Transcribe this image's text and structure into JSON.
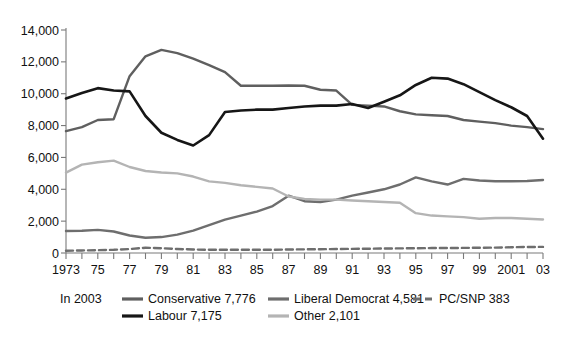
{
  "chart_data": {
    "type": "line",
    "title": "",
    "xlabel": "",
    "ylabel": "",
    "ylim": [
      0,
      14000
    ],
    "xlim": [
      1973,
      2003
    ],
    "yticks": [
      0,
      2000,
      4000,
      6000,
      8000,
      10000,
      12000,
      14000
    ],
    "ytick_labels": [
      "0",
      "2,000",
      "4,000",
      "6,000",
      "8,000",
      "10,000",
      "12,000",
      "14,000"
    ],
    "x": [
      1973,
      1974,
      1975,
      1976,
      1977,
      1978,
      1979,
      1980,
      1981,
      1982,
      1983,
      1984,
      1985,
      1986,
      1987,
      1988,
      1989,
      1990,
      1991,
      1992,
      1993,
      1994,
      1995,
      1996,
      1997,
      1998,
      1999,
      2000,
      2001,
      2002,
      2003
    ],
    "xtick_labels": [
      "1973",
      "",
      "75",
      "",
      "77",
      "",
      "79",
      "",
      "81",
      "",
      "83",
      "",
      "85",
      "",
      "87",
      "",
      "89",
      "",
      "91",
      "",
      "93",
      "",
      "95",
      "",
      "97",
      "",
      "99",
      "",
      "2001",
      "",
      "03"
    ],
    "grid": false,
    "legend_position": "bottom",
    "series": [
      {
        "name": "Conservative",
        "label": "Conservative 7,776",
        "final_value": 7776,
        "color": "#5f5f5f",
        "style": "solid",
        "values": [
          7650,
          7900,
          8350,
          8400,
          11100,
          12350,
          12750,
          12550,
          12200,
          11800,
          11350,
          10500,
          10500,
          10500,
          10520,
          10500,
          10250,
          10200,
          9300,
          9250,
          9200,
          8900,
          8700,
          8650,
          8600,
          8350,
          8250,
          8150,
          8000,
          7900,
          7776
        ]
      },
      {
        "name": "Labour",
        "label": "Labour 7,175",
        "final_value": 7175,
        "color": "#161616",
        "style": "solid",
        "values": [
          9700,
          10050,
          10350,
          10200,
          10150,
          8600,
          7550,
          7100,
          6750,
          7400,
          8850,
          8950,
          9000,
          9000,
          9100,
          9200,
          9250,
          9250,
          9350,
          9100,
          9500,
          9900,
          10550,
          11000,
          10950,
          10600,
          10100,
          9600,
          9150,
          8600,
          7175
        ]
      },
      {
        "name": "Liberal Democrat",
        "label": "Liberal Democrat 4,581",
        "final_value": 4581,
        "color": "#6e6e6e",
        "style": "solid",
        "values": [
          1380,
          1400,
          1450,
          1350,
          1100,
          960,
          1000,
          1150,
          1400,
          1750,
          2100,
          2350,
          2600,
          2950,
          3600,
          3250,
          3200,
          3350,
          3600,
          3800,
          4000,
          4300,
          4750,
          4500,
          4300,
          4650,
          4550,
          4500,
          4500,
          4520,
          4581
        ]
      },
      {
        "name": "Other",
        "label": "Other 2,101",
        "final_value": 2101,
        "color": "#b4b4b4",
        "style": "solid",
        "values": [
          5050,
          5550,
          5700,
          5800,
          5400,
          5150,
          5050,
          5000,
          4800,
          4500,
          4400,
          4250,
          4150,
          4050,
          3550,
          3400,
          3350,
          3350,
          3300,
          3250,
          3200,
          3150,
          2500,
          2350,
          2300,
          2250,
          2150,
          2200,
          2200,
          2150,
          2101
        ]
      },
      {
        "name": "PC/SNP",
        "label": "PC/SNP 383",
        "final_value": 383,
        "color": "#6e6e6e",
        "style": "dashed",
        "values": [
          140,
          160,
          180,
          200,
          250,
          330,
          300,
          250,
          220,
          200,
          200,
          200,
          200,
          200,
          220,
          230,
          240,
          250,
          260,
          270,
          280,
          290,
          300,
          310,
          310,
          320,
          330,
          340,
          360,
          380,
          383
        ]
      }
    ]
  },
  "legend": {
    "prefix": "In 2003",
    "entries": [
      {
        "key": "conservative",
        "label": "Conservative 7,776"
      },
      {
        "key": "labour",
        "label": "Labour 7,175"
      },
      {
        "key": "liberal-democrat",
        "label": "Liberal Democrat 4,581"
      },
      {
        "key": "other",
        "label": "Other 2,101"
      },
      {
        "key": "pc-snp",
        "label": "PC/SNP 383"
      }
    ]
  },
  "colors": {
    "conservative": "#5f5f5f",
    "labour": "#161616",
    "liberal_democrat": "#6e6e6e",
    "other": "#b4b4b4",
    "pc_snp": "#6e6e6e",
    "axis": "#7a7a7a",
    "text": "#111111",
    "background": "#ffffff"
  }
}
